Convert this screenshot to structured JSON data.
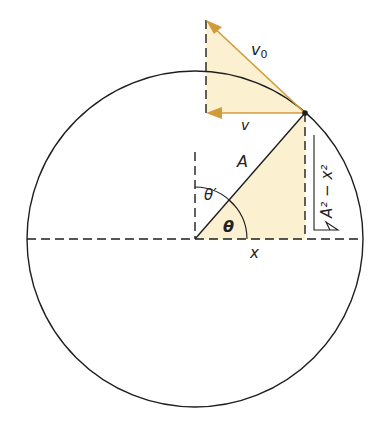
{
  "diagram": {
    "colors": {
      "fill": "#fbf0cf",
      "arrow": "#d29b3a",
      "line": "#1e1e1e"
    },
    "labels": {
      "v0": "v",
      "v0_sub": "0",
      "v": "v",
      "A": "A",
      "theta_prime": "θ′",
      "theta": "θ",
      "x": "x",
      "sqrt_expr": "A² − x²"
    }
  }
}
